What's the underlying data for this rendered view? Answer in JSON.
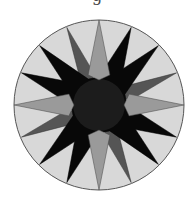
{
  "caption_fragment": "g",
  "figure": {
    "center": [
      99,
      105
    ],
    "radius": 85,
    "colors": {
      "background_ring": "#d8d8d8",
      "outline": "#555555",
      "primary_points": "#9a9a9a",
      "secondary_points": "#555555",
      "black_star": "#080808",
      "center_disc": "#1c1c1c"
    },
    "black_star_points": "99,77 131.2,27.4 123.5,68.4 158.4,45.6 124.9,94.3 127,105 176.6,137.2 135.6,129.5 158.4,164.4 109.7,130.9 99,133 66.8,182.6 74.5,141.6 39.6,164.4 73.1,115.7 71,105 21.4,72.8 62.4,80.5 39.6,45.6 88.3,79.1",
    "secondary_points": [
      {
        "direction": "ENE",
        "points": "99,105 131.0,84.6 176.6,72.8 136.1,96.8"
      },
      {
        "direction": "SSE",
        "points": "99,105 119.4,137.0 131.2,182.6 107.2,142.1"
      },
      {
        "direction": "WSW",
        "points": "99,105 67.0,125.4 21.4,137.2 61.9,113.2"
      },
      {
        "direction": "NNW",
        "points": "99,105 78.6,73.0 66.8,27.4 90.8,67.9"
      }
    ],
    "primary_points": [
      {
        "direction": "N",
        "points": "99,80 88.1,74.9 99,20 109.9,74.9"
      },
      {
        "direction": "E",
        "points": "124,105 129.1,94.1 184,105 129.1,115.9"
      },
      {
        "direction": "S",
        "points": "99,130 109.9,135.1 99,190 88.1,135.1"
      },
      {
        "direction": "W",
        "points": "74,105 68.9,115.9 14,105 68.9,94.1"
      }
    ],
    "center_disc_radius": 26
  }
}
